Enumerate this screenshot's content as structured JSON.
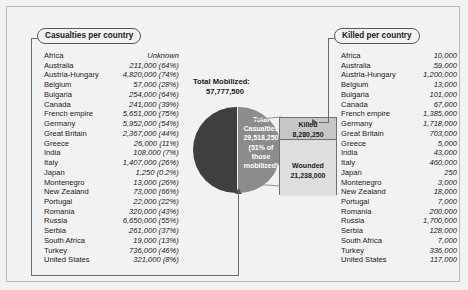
{
  "chart_data": {
    "type": "pie",
    "title": "Total Mobilized:",
    "total_mobilized": "57,777,500",
    "pie_center_label": "Total Casualties 29,518,250 (51% of those mobilized)",
    "slices": [
      {
        "name": "Total Casualties",
        "value": 29518250,
        "percent": 51,
        "color": "#8c8c8c"
      },
      {
        "name": "Survived / other",
        "value": 28259250,
        "percent": 49,
        "color": "#3f3f3f"
      }
    ],
    "breakout": {
      "type": "bar",
      "stacked": true,
      "segments": [
        {
          "name": "Killed",
          "value": 8280250,
          "label": "8,280,250",
          "color": "#c6c6c6"
        },
        {
          "name": "Wounded",
          "value": 21238000,
          "label": "21,238,000",
          "color": "#dedede"
        }
      ]
    },
    "categories": [
      "Africa",
      "Australia",
      "Austria-Hungary",
      "Belgium",
      "Bulgaria",
      "Canada",
      "French empire",
      "Germany",
      "Great Britain",
      "Greece",
      "India",
      "Italy",
      "Japan",
      "Montenegro",
      "New Zealand",
      "Portugal",
      "Romania",
      "Russia",
      "Serbia",
      "South Africa",
      "Turkey",
      "United States"
    ],
    "series": [
      {
        "name": "Casualties per country",
        "values": [
          null,
          211000,
          4820000,
          57000,
          254000,
          241000,
          5651000,
          5952000,
          2367000,
          26000,
          108000,
          1407000,
          1250,
          13000,
          73000,
          22000,
          320000,
          6650000,
          261000,
          19000,
          736000,
          321000
        ]
      },
      {
        "name": "Killed per country",
        "values": [
          10000,
          59000,
          1200000,
          13000,
          101000,
          67000,
          1385000,
          1718000,
          703000,
          5000,
          43000,
          460000,
          250,
          3000,
          18000,
          7000,
          200000,
          1700000,
          128000,
          7000,
          336000,
          117000
        ]
      }
    ]
  },
  "pie": {
    "center_lines": [
      "Total",
      "Casualties",
      "29,518,250",
      "(51% of",
      "those",
      "mobilized)"
    ]
  },
  "mobilized": {
    "label": "Total Mobilized:",
    "value": "57,777,500"
  },
  "bar": {
    "killed_label": "Killed",
    "killed_value": "8,280,250",
    "wounded_label": "Wounded",
    "wounded_value": "21,238,000"
  },
  "left_panel": {
    "title": "Casualties per country",
    "rows": [
      {
        "name": "Africa",
        "value": "Unknown"
      },
      {
        "name": "Australia",
        "value": "211,000 (64%)"
      },
      {
        "name": "Austria-Hungary",
        "value": "4,820,000 (74%)"
      },
      {
        "name": "Belgium",
        "value": "57,000 (28%)"
      },
      {
        "name": "Bulgaria",
        "value": "254,000 (64%)"
      },
      {
        "name": "Canada",
        "value": "241,000 (39%)"
      },
      {
        "name": "French empire",
        "value": "5,651,000 (75%)"
      },
      {
        "name": "Germany",
        "value": "5,952,000 (54%)"
      },
      {
        "name": "Great Britain",
        "value": "2,367,000 (44%)"
      },
      {
        "name": "Greece",
        "value": "26,000 (11%)"
      },
      {
        "name": "India",
        "value": "108,000 (7%)"
      },
      {
        "name": "Italy",
        "value": "1,407,000 (26%)"
      },
      {
        "name": "Japan",
        "value": "1,250 (0.2%)"
      },
      {
        "name": "Montenegro",
        "value": "13,000 (26%)"
      },
      {
        "name": "New Zealand",
        "value": "73,000 (66%)"
      },
      {
        "name": "Portugal",
        "value": "22,000 (22%)"
      },
      {
        "name": "Romania",
        "value": "320,000 (43%)"
      },
      {
        "name": "Russia",
        "value": "6,650,000 (55%)"
      },
      {
        "name": "Serbia",
        "value": "261,000 (37%)"
      },
      {
        "name": "South Africa",
        "value": "19,000 (13%)"
      },
      {
        "name": "Turkey",
        "value": "736,000 (46%)"
      },
      {
        "name": "United States",
        "value": "321,000 (8%)"
      }
    ]
  },
  "right_panel": {
    "title": "Killed per country",
    "rows": [
      {
        "name": "Africa",
        "value": "10,000"
      },
      {
        "name": "Australia",
        "value": "59,000"
      },
      {
        "name": "Austria-Hungary",
        "value": "1,200,000"
      },
      {
        "name": "Belgium",
        "value": "13,000"
      },
      {
        "name": "Bulgaria",
        "value": "101,000"
      },
      {
        "name": "Canada",
        "value": "67,000"
      },
      {
        "name": "French empire",
        "value": "1,385,000"
      },
      {
        "name": "Germany",
        "value": "1,718,000"
      },
      {
        "name": "Great Britain",
        "value": "703,000"
      },
      {
        "name": "Greece",
        "value": "5,000"
      },
      {
        "name": "India",
        "value": "43,000"
      },
      {
        "name": "Italy",
        "value": "460,000"
      },
      {
        "name": "Japan",
        "value": "250"
      },
      {
        "name": "Montenegro",
        "value": "3,000"
      },
      {
        "name": "New Zealand",
        "value": "18,000"
      },
      {
        "name": "Portugal",
        "value": "7,000"
      },
      {
        "name": "Romania",
        "value": "200,000"
      },
      {
        "name": "Russia",
        "value": "1,700,000"
      },
      {
        "name": "Serbia",
        "value": "128,000"
      },
      {
        "name": "South Africa",
        "value": "7,000"
      },
      {
        "name": "Turkey",
        "value": "336,000"
      },
      {
        "name": "United States",
        "value": "117,000"
      }
    ]
  },
  "colors": {
    "pie_dark": "#3f3f3f",
    "pie_light": "#8c8c8c",
    "killed_bar": "#c6c6c6",
    "wounded_bar": "#dedede",
    "background": "#f2f2f2",
    "rule": "#6b6b6b"
  }
}
